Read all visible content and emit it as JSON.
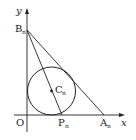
{
  "diagram": {
    "axes": {
      "x_label": "x",
      "y_label": "y",
      "origin_label": "O"
    },
    "points": [
      {
        "name": "B",
        "sub": "n",
        "role": "y-intercept of tangent line"
      },
      {
        "name": "A",
        "sub": "n",
        "role": "x-intercept of tangent line"
      },
      {
        "name": "P",
        "sub": "n",
        "role": "circle tangent point on x-axis / end of chord from B"
      },
      {
        "name": "C",
        "sub": "n",
        "role": "circle center"
      }
    ],
    "shapes": [
      {
        "type": "circle",
        "center": "Cn",
        "tangent_to": [
          "x-axis",
          "y-axis",
          "line AnBn"
        ]
      },
      {
        "type": "segment",
        "from": "Bn",
        "to": "An"
      },
      {
        "type": "segment",
        "from": "Bn",
        "to": "Pn",
        "through": "Cn"
      }
    ],
    "colors": {
      "stroke": "#222222",
      "background": "#ffffff"
    }
  }
}
